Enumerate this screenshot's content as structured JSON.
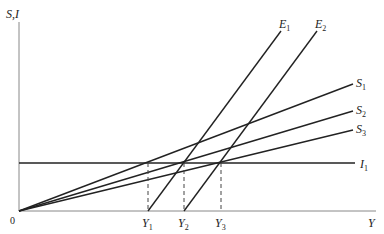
{
  "diagram": {
    "y_axis_label": "S,I",
    "x_axis_label": "Y",
    "origin_label": "0",
    "lines": [
      {
        "name": "E",
        "sub": "1"
      },
      {
        "name": "E",
        "sub": "2"
      },
      {
        "name": "S",
        "sub": "1"
      },
      {
        "name": "S",
        "sub": "2"
      },
      {
        "name": "S",
        "sub": "3"
      },
      {
        "name": "I",
        "sub": "1"
      }
    ],
    "x_ticks": [
      {
        "name": "Y",
        "sub": "1"
      },
      {
        "name": "Y",
        "sub": "2"
      },
      {
        "name": "Y",
        "sub": "3"
      }
    ],
    "line_color": "#222222"
  }
}
